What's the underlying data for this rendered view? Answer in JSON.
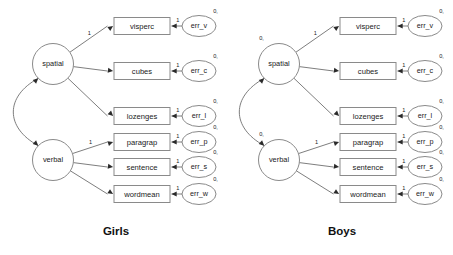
{
  "figure": {
    "title": "",
    "type": "sem-path-diagram",
    "background_color": "#ffffff",
    "stroke_color": "#8a8a8a",
    "edge_color": "#6f6f6f",
    "text_color": "#1a1a1a"
  },
  "groups": [
    {
      "id": "girls",
      "title": "Girls",
      "latents": [
        {
          "id": "spatial",
          "label": "spatial",
          "mean_label": ""
        },
        {
          "id": "verbal",
          "label": "verbal",
          "mean_label": ""
        }
      ],
      "observed": [
        {
          "id": "visperc",
          "label": "visperc",
          "loading": "1",
          "error": {
            "id": "err_v",
            "label": "err_v",
            "variance_label": "0,",
            "path_label": "1"
          }
        },
        {
          "id": "cubes",
          "label": "cubes",
          "loading": "",
          "error": {
            "id": "err_c",
            "label": "err_c",
            "variance_label": "0,",
            "path_label": "1"
          }
        },
        {
          "id": "lozenges",
          "label": "lozenges",
          "loading": "",
          "error": {
            "id": "err_l",
            "label": "err_l",
            "variance_label": "0,",
            "path_label": "1"
          }
        },
        {
          "id": "paragrap",
          "label": "paragrap",
          "loading": "1",
          "error": {
            "id": "err_p",
            "label": "err_p",
            "variance_label": "0,",
            "path_label": "1"
          }
        },
        {
          "id": "sentence",
          "label": "sentence",
          "loading": "",
          "error": {
            "id": "err_s",
            "label": "err_s",
            "variance_label": "0,",
            "path_label": "1"
          }
        },
        {
          "id": "wordmean",
          "label": "wordmean",
          "loading": "",
          "error": {
            "id": "err_w",
            "label": "err_w",
            "variance_label": "0,",
            "path_label": "1"
          }
        }
      ],
      "covariance": {
        "from": "spatial",
        "to": "verbal",
        "label": "",
        "double_headed": true
      }
    },
    {
      "id": "boys",
      "title": "Boys",
      "latents": [
        {
          "id": "spatial",
          "label": "spatial",
          "mean_label": "0,"
        },
        {
          "id": "verbal",
          "label": "verbal",
          "mean_label": "0,"
        }
      ],
      "observed": [
        {
          "id": "visperc",
          "label": "visperc",
          "loading": "1",
          "error": {
            "id": "err_v",
            "label": "err_v",
            "variance_label": "0,",
            "path_label": "1"
          }
        },
        {
          "id": "cubes",
          "label": "cubes",
          "loading": "",
          "error": {
            "id": "err_c",
            "label": "err_c",
            "variance_label": "0,",
            "path_label": "1"
          }
        },
        {
          "id": "lozenges",
          "label": "lozenges",
          "loading": "",
          "error": {
            "id": "err_l",
            "label": "err_l",
            "variance_label": "0,",
            "path_label": "1"
          }
        },
        {
          "id": "paragrap",
          "label": "paragrap",
          "loading": "1",
          "error": {
            "id": "err_p",
            "label": "err_p",
            "variance_label": "0,",
            "path_label": "1"
          }
        },
        {
          "id": "sentence",
          "label": "sentence",
          "loading": "",
          "error": {
            "id": "err_s",
            "label": "err_s",
            "variance_label": "0,",
            "path_label": "1"
          }
        },
        {
          "id": "wordmean",
          "label": "wordmean",
          "loading": "",
          "error": {
            "id": "err_w",
            "label": "err_w",
            "variance_label": "0,",
            "path_label": "1"
          }
        }
      ],
      "covariance": {
        "from": "spatial",
        "to": "verbal",
        "label": "",
        "double_headed": true
      }
    }
  ]
}
